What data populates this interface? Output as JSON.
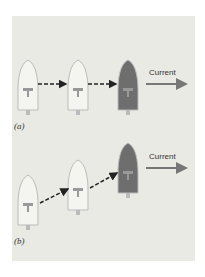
{
  "figure": {
    "panels": [
      {
        "id": "a",
        "label": "(a)",
        "current_label": "Current",
        "boats": 3,
        "path": "horizontal"
      },
      {
        "id": "b",
        "label": "(b)",
        "current_label": "Current",
        "boats": 3,
        "path": "diagonal"
      }
    ],
    "colors": {
      "water": "#eaeae4",
      "boat_light": "#f4f4f0",
      "boat_dark": "#6e6e6e",
      "arrow": "#222222",
      "current_arrow": "#777777"
    }
  }
}
